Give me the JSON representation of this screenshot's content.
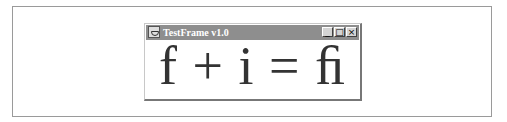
{
  "window": {
    "title": "TestFrame v1.0",
    "icon": "java-cup-icon",
    "controls": {
      "minimize": "_",
      "maximize": "□",
      "close": "×"
    }
  },
  "content": {
    "equation": "f + i = ﬁ"
  }
}
